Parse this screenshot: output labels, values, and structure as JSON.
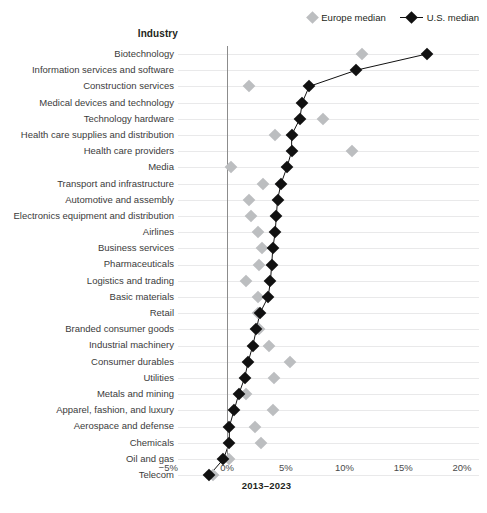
{
  "header": {
    "industry_label": "Industry"
  },
  "legend": {
    "position": "top-right",
    "items": [
      {
        "label": "Europe median",
        "marker": "diamond",
        "color": "#bcbec0",
        "icon": "diamond-icon"
      },
      {
        "label": "U.S. median",
        "marker": "diamond-line",
        "color": "#111111",
        "icon": "diamond-line-icon"
      }
    ]
  },
  "chart_data": {
    "type": "scatter",
    "title": "",
    "subtitle": "",
    "xlabel": "2013–2023",
    "ylabel": "Industry",
    "xlim": [
      -5,
      20
    ],
    "xticks": [
      -5,
      0,
      5,
      10,
      15,
      20
    ],
    "xticklabels": [
      "−5%",
      "0%",
      "5%",
      "10%",
      "15%",
      "20%"
    ],
    "grid": true,
    "zero_reference_line": 0,
    "categories": [
      "Biotechnology",
      "Information services and software",
      "Construction services",
      "Medical devices and technology",
      "Technology hardware",
      "Health care supplies and distribution",
      "Health care providers",
      "Media",
      "Transport and infrastructure",
      "Automotive and assembly",
      "Electronics equipment and distribution",
      "Airlines",
      "Business services",
      "Pharmaceuticals",
      "Logistics and trading",
      "Basic materials",
      "Retail",
      "Branded consumer goods",
      "Industrial machinery",
      "Consumer durables",
      "Utilities",
      "Metals and mining",
      "Apparel, fashion, and luxury",
      "Aerospace and defense",
      "Chemicals",
      "Oil and gas",
      "Telecom"
    ],
    "series": [
      {
        "name": "Europe median",
        "color": "#bcbec0",
        "values": [
          11.5,
          null,
          1.9,
          null,
          8.2,
          4.1,
          10.6,
          0.3,
          3.1,
          1.9,
          2.0,
          2.6,
          3.0,
          2.7,
          1.6,
          2.6,
          2.6,
          2.7,
          3.6,
          5.4,
          4.0,
          1.6,
          3.9,
          2.4,
          2.9,
          0.2,
          -1.2
        ]
      },
      {
        "name": "U.S. median",
        "color": "#111111",
        "values": [
          17.0,
          11.0,
          7.0,
          6.4,
          6.2,
          5.5,
          5.5,
          5.1,
          4.6,
          4.3,
          4.2,
          4.1,
          3.9,
          3.8,
          3.7,
          3.5,
          2.8,
          2.5,
          2.2,
          1.8,
          1.5,
          1.0,
          0.6,
          0.2,
          0.2,
          -0.3,
          -1.5
        ]
      }
    ]
  }
}
